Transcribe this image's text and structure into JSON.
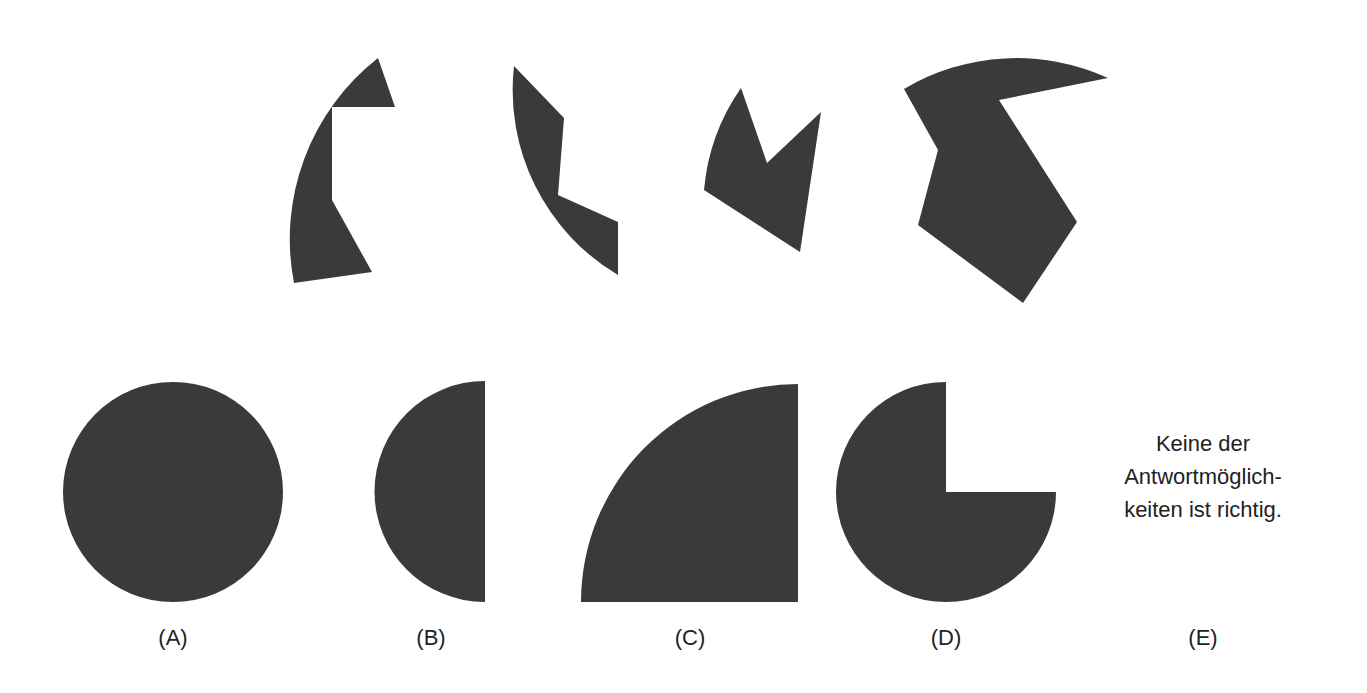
{
  "puzzle": {
    "fill_color": "#3a3a3a",
    "pieces": [
      {
        "name": "piece-1",
        "points": "378,58 395,107 332,107 332,200 372,272 294,283"
      },
      {
        "name": "piece-2",
        "points": "514,66 564,118 558,195 618,222 618,275"
      },
      {
        "name": "piece-3",
        "points": "741,88 767,163 821,112 800,252 704,190"
      },
      {
        "name": "piece-4",
        "points": "904,89 1108,78 999,100 1077,222 1023,303 918,225 938,150"
      }
    ]
  },
  "options": [
    {
      "label": "(A)",
      "shape": "full-circle"
    },
    {
      "label": "(B)",
      "shape": "half-circle"
    },
    {
      "label": "(C)",
      "shape": "quarter-circle"
    },
    {
      "label": "(D)",
      "shape": "three-quarter-circle"
    },
    {
      "label": "(E)",
      "text_lines": [
        "Keine der",
        "Antwortmöglich-",
        "keiten ist richtig."
      ]
    }
  ]
}
